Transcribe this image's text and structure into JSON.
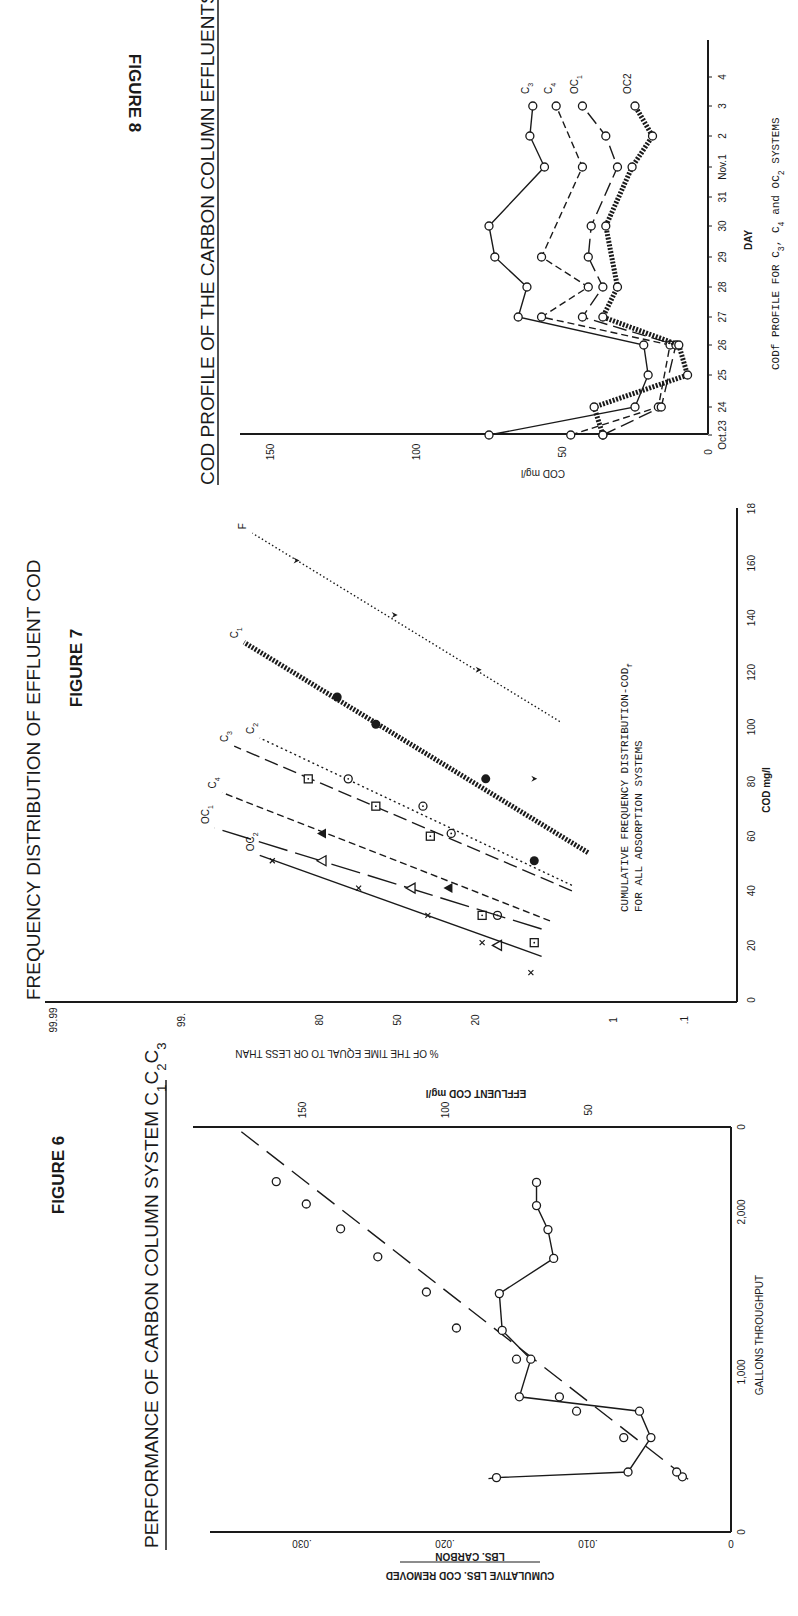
{
  "chart_data": [
    {
      "id": "figure-6",
      "figure_label": "FIGURE 6",
      "type": "line",
      "title": "PERFORMANCE OF CARBON COLUMN SYSTEM C1 C2 C3",
      "title_parts": {
        "main": "PERFORMANCE OF CARBON COLUMN SYSTEM",
        "sub": [
          "C",
          "1",
          "C",
          "2",
          "C",
          "3"
        ]
      },
      "xlabel": "GALLONS THROUGHPUT",
      "ylabel_left": "CUMULATIVE LBS. COD REMOVED",
      "ylabel_left_denominator": "LBS. CARBON",
      "ylabel_right": "EFFLUENT COD mg/l",
      "xlim": [
        0,
        2550
      ],
      "ylim_left": [
        0,
        0.035
      ],
      "ylim_right": [
        0,
        175
      ],
      "x_ticks": [
        0,
        1000,
        2000
      ],
      "x_tick_labels": [
        "0",
        "1,000",
        "2,000"
      ],
      "y_left_ticks": [
        0,
        0.01,
        0.02,
        0.03
      ],
      "y_left_tick_labels": [
        "0",
        ".010",
        ".020",
        ".030"
      ],
      "y_right_ticks": [
        0,
        50,
        100,
        150
      ],
      "y_right_tick_labels": [
        "0",
        "50",
        "100",
        "150"
      ],
      "series": [
        {
          "name": "Cumulative lbs COD removed / lbs carbon",
          "axis": "left",
          "style": "long-dash fit line with open circles",
          "fit_line": {
            "x": [
              330,
              2520
            ],
            "y": [
              0.003,
              0.0345
            ]
          },
          "points": [
            {
              "x": 345,
              "y": 0.0034
            },
            {
              "x": 375,
              "y": 0.0038
            },
            {
              "x": 590,
              "y": 0.0075
            },
            {
              "x": 755,
              "y": 0.0108
            },
            {
              "x": 845,
              "y": 0.012
            },
            {
              "x": 1080,
              "y": 0.015
            },
            {
              "x": 1275,
              "y": 0.0192
            },
            {
              "x": 1500,
              "y": 0.0213
            },
            {
              "x": 1720,
              "y": 0.0247
            },
            {
              "x": 1895,
              "y": 0.0273
            },
            {
              "x": 2050,
              "y": 0.0297
            },
            {
              "x": 2190,
              "y": 0.0318
            }
          ]
        },
        {
          "name": "Effluent COD",
          "axis": "right",
          "style": "solid line with open circles",
          "points": [
            {
              "x": 340,
              "y": 82
            },
            {
              "x": 375,
              "y": 36
            },
            {
              "x": 590,
              "y": 28
            },
            {
              "x": 755,
              "y": 32
            },
            {
              "x": 845,
              "y": 74
            },
            {
              "x": 1080,
              "y": 70
            },
            {
              "x": 1260,
              "y": 80
            },
            {
              "x": 1490,
              "y": 81
            },
            {
              "x": 1710,
              "y": 62
            },
            {
              "x": 1890,
              "y": 64
            },
            {
              "x": 2040,
              "y": 68
            },
            {
              "x": 2185,
              "y": 68
            }
          ]
        }
      ]
    },
    {
      "id": "figure-7",
      "figure_label": "FIGURE 7",
      "type": "line",
      "title": "FREQUENCY DISTRIBUTION OF EFFLUENT COD",
      "xlabel": "COD mg/l",
      "ylabel": "% OF THE TIME EQUAL TO OR LESS THAN",
      "y_scale": "normal probability",
      "xlim": [
        0,
        180
      ],
      "x_ticks": [
        0,
        20,
        40,
        60,
        80,
        100,
        120,
        140,
        160,
        180
      ],
      "x_tick_labels": [
        "0",
        "20",
        "40",
        "60",
        "80",
        "100",
        "120",
        "140",
        "160",
        "18"
      ],
      "y_ticks": [
        0.1,
        1,
        20,
        50,
        80,
        99,
        99.99
      ],
      "y_tick_labels": [
        ".1",
        "1",
        "20",
        "50",
        "80",
        "99.",
        "99.99"
      ],
      "annotation": [
        "CUMULATIVE FREQUENCY DISTRIBUTION-COD",
        "f",
        "FOR ALL ADSORPTION SYSTEMS"
      ],
      "series": [
        {
          "name": "F",
          "label": "F",
          "style": "fine dotted",
          "marker": "filled-arrowhead",
          "line": {
            "x": [
              102,
              171
            ],
            "y": [
              4,
              94
            ]
          },
          "points": [
            {
              "x": 161,
              "y": 86
            },
            {
              "x": 141,
              "y": 51
            },
            {
              "x": 121,
              "y": 19
            },
            {
              "x": 81,
              "y": 7
            }
          ]
        },
        {
          "name": "C1",
          "label": "C",
          "label_sub": "1",
          "style": "heavy dotted",
          "marker": "filled-circle",
          "line": {
            "x": [
              54,
              131
            ],
            "y": [
              2,
              95
            ]
          },
          "points": [
            {
              "x": 111,
              "y": 74
            },
            {
              "x": 101,
              "y": 59
            },
            {
              "x": 81,
              "y": 17
            },
            {
              "x": 51,
              "y": 7
            }
          ]
        },
        {
          "name": "C2",
          "label": "C",
          "label_sub": "2",
          "style": "dotted",
          "marker": "dotted-circle",
          "line": {
            "x": [
              42,
              96
            ],
            "y": [
              3,
              93
            ]
          },
          "points": [
            {
              "x": 81,
              "y": 70
            },
            {
              "x": 71,
              "y": 39
            },
            {
              "x": 61,
              "y": 28
            },
            {
              "x": 31,
              "y": 14
            }
          ]
        },
        {
          "name": "C3",
          "label": "C",
          "label_sub": "3",
          "style": "long dash",
          "marker": "dotted-square",
          "line": {
            "x": [
              40,
              93
            ],
            "y": [
              3,
              96
            ]
          },
          "points": [
            {
              "x": 81,
              "y": 83
            },
            {
              "x": 71,
              "y": 59
            },
            {
              "x": 60,
              "y": 36
            },
            {
              "x": 31,
              "y": 18
            },
            {
              "x": 21,
              "y": 7
            }
          ]
        },
        {
          "name": "C4",
          "label": "C",
          "label_sub": "4",
          "style": "dashed",
          "marker": "filled-triangle",
          "line": {
            "x": [
              29,
              76
            ],
            "y": [
              5,
              97
            ]
          },
          "points": [
            {
              "x": 61,
              "y": 79
            },
            {
              "x": 41,
              "y": 29
            }
          ]
        },
        {
          "name": "OC1",
          "label": "OC",
          "label_sub": "1",
          "style": "solid broken",
          "marker": "open-triangle",
          "line": {
            "x": [
              26,
              63
            ],
            "y": [
              6,
              97.5
            ]
          },
          "points": [
            {
              "x": 51,
              "y": 79
            },
            {
              "x": 41,
              "y": 44
            },
            {
              "x": 20,
              "y": 14
            }
          ]
        },
        {
          "name": "OC2",
          "label": "OC",
          "label_sub": "2",
          "style": "solid",
          "marker": "x",
          "line": {
            "x": [
              16,
              53
            ],
            "y": [
              6,
              93
            ]
          },
          "points": [
            {
              "x": 51,
              "y": 91
            },
            {
              "x": 41,
              "y": 66
            },
            {
              "x": 31,
              "y": 37
            },
            {
              "x": 21,
              "y": 18
            },
            {
              "x": 10,
              "y": 7.5
            }
          ]
        }
      ]
    },
    {
      "id": "figure-8",
      "figure_label": "FIGURE 8",
      "type": "line",
      "title": "COD PROFILE OF THE CARBON COLUMN EFFLUENTS",
      "xlabel": "DAY",
      "ylabel": "COD mg/l",
      "caption": [
        "CODf PROFILE FOR C",
        "3",
        ", C",
        "4",
        " and OC",
        "2",
        " SYSTEMS"
      ],
      "caption_text": "CODf PROFILE FOR C3, C4 and OC2 SYSTEMS",
      "ylim": [
        0,
        160
      ],
      "y_ticks": [
        0,
        50,
        100,
        150
      ],
      "y_tick_labels": [
        "0",
        "50",
        "100",
        "150"
      ],
      "categories": [
        "Oct.23",
        "24",
        "25",
        "26",
        "27",
        "28",
        "29",
        "30",
        "31",
        "Nov.1",
        "2",
        "3",
        "4"
      ],
      "series": [
        {
          "name": "C3",
          "label": "C",
          "label_sub": "3",
          "style": "solid",
          "values": [
            75,
            25,
            20.5,
            22,
            65,
            62,
            73,
            75,
            null,
            56,
            61,
            60,
            null
          ]
        },
        {
          "name": "C4",
          "label": "C",
          "label_sub": "4",
          "style": "dashed",
          "values": [
            47,
            17,
            null,
            13,
            57,
            41,
            57,
            null,
            null,
            43,
            null,
            52,
            null
          ]
        },
        {
          "name": "OC1",
          "label": "OC",
          "label_sub": "1",
          "style": "long dash",
          "values": [
            36,
            16,
            null,
            11,
            43,
            36,
            41,
            40,
            null,
            31,
            35,
            43,
            null
          ]
        },
        {
          "name": "OC2",
          "label": "OC2",
          "label_sub": "",
          "style": "heavy dotted",
          "values": [
            36,
            39,
            7,
            10,
            36,
            31,
            null,
            35,
            null,
            26,
            19,
            25,
            null
          ]
        }
      ]
    }
  ]
}
